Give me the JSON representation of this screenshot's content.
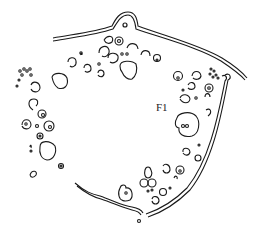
{
  "diagram": {
    "type": "line-drawing",
    "labels": [
      {
        "id": "f1",
        "text": "F1",
        "x": 156,
        "y": 107
      }
    ],
    "colors": {
      "ink": "#1a1a1a",
      "background": "#ffffff"
    }
  }
}
